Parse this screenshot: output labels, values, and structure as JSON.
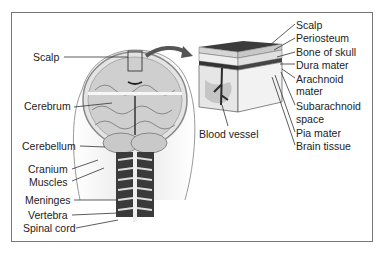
{
  "diagram": {
    "left_labels": [
      {
        "text": "Scalp",
        "x": 33,
        "y": 51
      },
      {
        "text": "Cerebrum",
        "x": 24,
        "y": 100
      },
      {
        "text": "Cerebellum",
        "x": 22,
        "y": 140
      },
      {
        "text": "Cranium",
        "x": 28,
        "y": 163
      },
      {
        "text": "Muscles",
        "x": 29,
        "y": 176
      },
      {
        "text": "Meninges",
        "x": 25,
        "y": 194
      },
      {
        "text": "Vertebra",
        "x": 28,
        "y": 209
      },
      {
        "text": "Spinal cord",
        "x": 23,
        "y": 222
      }
    ],
    "inset_labels": [
      {
        "text": "Scalp",
        "x": 296,
        "y": 19
      },
      {
        "text": "Periosteum",
        "x": 296,
        "y": 32
      },
      {
        "text": "Bone of skull",
        "x": 296,
        "y": 46
      },
      {
        "text": "Dura mater",
        "x": 296,
        "y": 59
      },
      {
        "text": "Arachnoid",
        "x": 296,
        "y": 73
      },
      {
        "text": "mater",
        "x": 296,
        "y": 85
      },
      {
        "text": "Subarachnoid",
        "x": 296,
        "y": 100
      },
      {
        "text": "space",
        "x": 296,
        "y": 113
      },
      {
        "text": "Pia mater",
        "x": 296,
        "y": 127
      },
      {
        "text": "Brain tissue",
        "x": 296,
        "y": 140
      }
    ],
    "blood_vessel_label": {
      "text": "Blood vessel",
      "x": 199,
      "y": 128
    }
  },
  "colors": {
    "frame": "#777777",
    "line": "#333333",
    "arrow": "#555555",
    "brain": "#bdbdbd",
    "dark": "#2a2a2a"
  }
}
